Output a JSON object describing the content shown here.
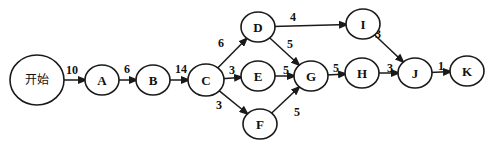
{
  "diagram": {
    "type": "activity-network",
    "nodes": [
      {
        "id": "start",
        "label": "开始",
        "cx": 37,
        "cy": 80,
        "r": 25
      },
      {
        "id": "A",
        "label": "A",
        "cx": 102,
        "cy": 80,
        "r": 15
      },
      {
        "id": "B",
        "label": "B",
        "cx": 153,
        "cy": 80,
        "r": 15
      },
      {
        "id": "C",
        "label": "C",
        "cx": 206,
        "cy": 80,
        "r": 16
      },
      {
        "id": "D",
        "label": "D",
        "cx": 258,
        "cy": 27,
        "r": 15
      },
      {
        "id": "E",
        "label": "E",
        "cx": 258,
        "cy": 76,
        "r": 15
      },
      {
        "id": "F",
        "label": "F",
        "cx": 260,
        "cy": 124,
        "r": 15
      },
      {
        "id": "G",
        "label": "G",
        "cx": 311,
        "cy": 76,
        "r": 15
      },
      {
        "id": "I",
        "label": "I",
        "cx": 363,
        "cy": 24,
        "r": 15
      },
      {
        "id": "H",
        "label": "H",
        "cx": 362,
        "cy": 73,
        "r": 15
      },
      {
        "id": "J",
        "label": "J",
        "cx": 415,
        "cy": 73,
        "r": 15
      },
      {
        "id": "K",
        "label": "K",
        "cx": 467,
        "cy": 71,
        "r": 15
      }
    ],
    "edges": [
      {
        "from": "start",
        "to": "A",
        "weight": "10",
        "lx": 66,
        "ly": 74
      },
      {
        "from": "A",
        "to": "B",
        "weight": "6",
        "lx": 124,
        "ly": 73
      },
      {
        "from": "B",
        "to": "C",
        "weight": "14",
        "lx": 175,
        "ly": 73
      },
      {
        "from": "C",
        "to": "D",
        "weight": "6",
        "lx": 218,
        "ly": 47
      },
      {
        "from": "C",
        "to": "E",
        "weight": "3",
        "lx": 229,
        "ly": 74
      },
      {
        "from": "C",
        "to": "F",
        "weight": "3",
        "lx": 216,
        "ly": 109
      },
      {
        "from": "D",
        "to": "I",
        "weight": "4",
        "lx": 290,
        "ly": 21
      },
      {
        "from": "D",
        "to": "G",
        "weight": "5",
        "lx": 287,
        "ly": 48
      },
      {
        "from": "E",
        "to": "G",
        "weight": "5",
        "lx": 283,
        "ly": 74
      },
      {
        "from": "F",
        "to": "G",
        "weight": "5",
        "lx": 294,
        "ly": 116
      },
      {
        "from": "G",
        "to": "H",
        "weight": "5",
        "lx": 333,
        "ly": 72
      },
      {
        "from": "I",
        "to": "J",
        "weight": "3",
        "lx": 375,
        "ly": 38
      },
      {
        "from": "H",
        "to": "J",
        "weight": "3",
        "lx": 387,
        "ly": 72
      },
      {
        "from": "J",
        "to": "K",
        "weight": "1",
        "lx": 438,
        "ly": 70
      }
    ]
  }
}
